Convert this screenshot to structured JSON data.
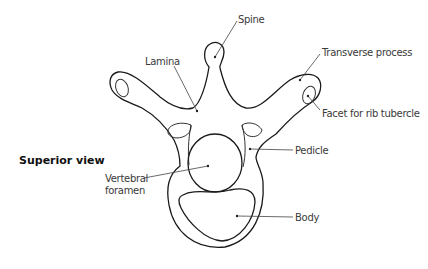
{
  "diagram": {
    "title": "Superior view",
    "labels": {
      "spine": "Spine",
      "lamina": "Lamina",
      "transverse_process": "Transverse process",
      "facet": "Facet for rib tubercle",
      "pedicle": "Pedicle",
      "vertebral_foramen_line1": "Vertebral",
      "vertebral_foramen_line2": "foramen",
      "body": "Body"
    },
    "colors": {
      "outline": "#1a1a1a",
      "leader": "#444444",
      "text": "#3a3a3a"
    }
  }
}
